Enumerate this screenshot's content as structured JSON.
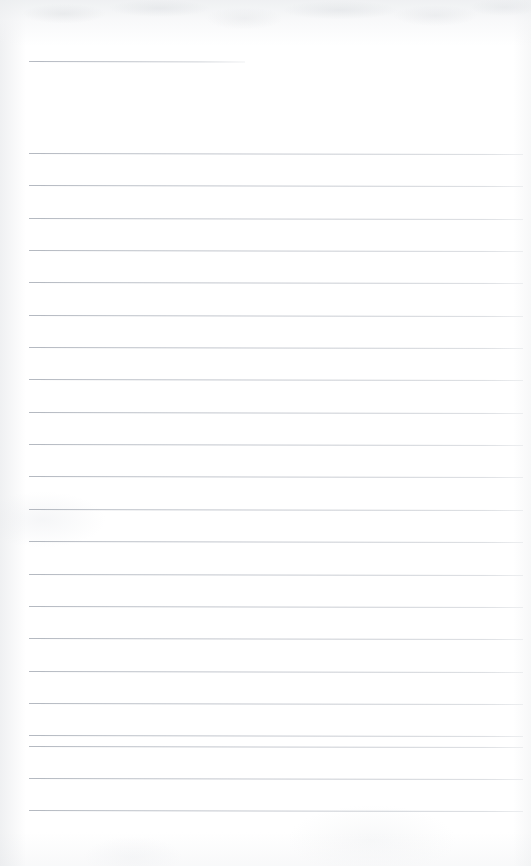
{
  "document": {
    "kind": "scanned-blank-lined-notebook-page",
    "page_width_px": 531,
    "page_height_px": 866,
    "background_color": "#ffffff",
    "rule_color": "#b9bdc5",
    "rule_thickness_px": 1,
    "text_content": "",
    "visible_text": []
  },
  "rules": {
    "left_margin_px": 29,
    "right_end_px": 523,
    "line_spacing_px": 32.3,
    "rotation_deg": 0.12,
    "header_line": {
      "label": "short-header-rule",
      "y": 61,
      "x_start": 29,
      "x_end": 245
    },
    "body_lines": [
      {
        "y": 153
      },
      {
        "y": 185
      },
      {
        "y": 218
      },
      {
        "y": 250
      },
      {
        "y": 282
      },
      {
        "y": 315
      },
      {
        "y": 347
      },
      {
        "y": 379
      },
      {
        "y": 412
      },
      {
        "y": 444
      },
      {
        "y": 476
      },
      {
        "y": 509
      },
      {
        "y": 541
      },
      {
        "y": 574
      },
      {
        "y": 606
      },
      {
        "y": 638
      },
      {
        "y": 671
      },
      {
        "y": 703
      },
      {
        "y": 735
      },
      {
        "y": 746
      },
      {
        "y": 778
      },
      {
        "y": 810
      }
    ]
  }
}
